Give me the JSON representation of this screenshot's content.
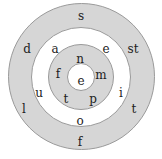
{
  "diagram": {
    "type": "concentric-circles-word-puzzle",
    "colors": {
      "gray_ring": "#d6d6d6",
      "white_ring": "#ffffff",
      "border": "#9a9a9a",
      "text": "#222222"
    },
    "rings": [
      {
        "name": "outer",
        "fill": "gray",
        "letters": [
          "s",
          "st",
          "t",
          "f",
          "l",
          "d"
        ]
      },
      {
        "name": "second",
        "fill": "white",
        "letters": [
          "e",
          "i",
          "o",
          "u",
          "a"
        ]
      },
      {
        "name": "third",
        "fill": "gray",
        "letters": [
          "n",
          "m",
          "p",
          "t",
          "f"
        ]
      },
      {
        "name": "center",
        "fill": "white",
        "letters": [
          "e"
        ]
      }
    ]
  }
}
